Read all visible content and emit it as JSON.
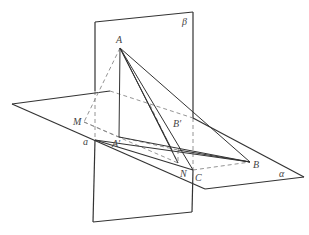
{
  "diagram": {
    "type": "3d-geometry-two-planes",
    "labels": {
      "plane_beta": "β",
      "plane_alpha": "α",
      "line_a": "a",
      "A": "A",
      "A_prime": "A′",
      "B": "B",
      "B_prime": "B′",
      "C": "C",
      "M": "M",
      "N": "N"
    },
    "colors": {
      "stroke": "#333333",
      "hidden": "#888888",
      "label": "#444444",
      "background": "#ffffff"
    }
  }
}
